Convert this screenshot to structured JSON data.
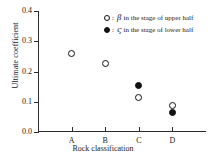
{
  "chart_data": {
    "type": "scatter",
    "title": "",
    "xlabel": "Rock classification",
    "ylabel": "Ultimate coefficient",
    "categories": [
      "A",
      "B",
      "C",
      "D"
    ],
    "yticks": [
      "0.0",
      "0.1",
      "0.2",
      "0.3",
      "0.4"
    ],
    "ylim": [
      0.0,
      0.4
    ],
    "grid": false,
    "legend_position": "upper-right",
    "series": [
      {
        "name": "upper-half",
        "marker": "open-circle",
        "symbol": "β",
        "legend_text": "in the stage of upper half",
        "color": "#111111",
        "points": [
          {
            "x": "A",
            "y": 0.26
          },
          {
            "x": "B",
            "y": 0.225
          },
          {
            "x": "C",
            "y": 0.115
          },
          {
            "x": "D",
            "y": 0.086
          }
        ]
      },
      {
        "name": "lower-half",
        "marker": "filled-circle",
        "symbol": "ς",
        "legend_text": "in the stage of lower half",
        "color": "#111111",
        "points": [
          {
            "x": "C",
            "y": 0.153
          },
          {
            "x": "D",
            "y": 0.066
          }
        ]
      }
    ]
  },
  "legend": {
    "rows": [
      {
        "marker": "open-circle",
        "colon": ":",
        "symbol": "β",
        "text": "in the stage of upper half"
      },
      {
        "marker": "filled-circle",
        "colon": ":",
        "symbol": "ς",
        "text": "in the stage of lower half"
      }
    ]
  },
  "axes": {
    "y_title": "Ultimate coefficient",
    "x_title": "Rock classification",
    "y_tick_labels": [
      "0.4",
      "0.3",
      "0.2",
      "0.1",
      "0.0"
    ],
    "x_tick_labels": [
      "A",
      "B",
      "C",
      "D"
    ]
  }
}
